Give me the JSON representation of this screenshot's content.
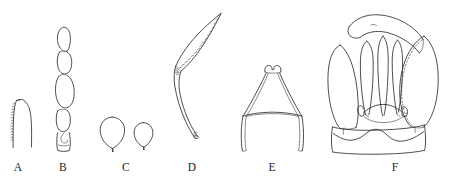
{
  "figure": {
    "type": "scientific-line-drawing-plate",
    "background_color": "#ffffff",
    "ink_color": "#2e2e30",
    "width": 456,
    "height": 181,
    "panel_count": 6,
    "label_row_y": 168
  },
  "panels": [
    {
      "id": "A",
      "label": "A",
      "label_x": 18,
      "label_y": 168,
      "subject": "serrated curved seta",
      "description": "slender curved spine with a row of fine teeth along the left margin"
    },
    {
      "id": "B",
      "label": "B",
      "label_x": 63,
      "label_y": 168,
      "subject": "segmented appendage",
      "description": "vertical chain of four to five elongate-oval articles, terminal article notched"
    },
    {
      "id": "C",
      "label": "C",
      "label_x": 126,
      "label_y": 168,
      "subject": "paired sensilla",
      "description": "two balloon- or teardrop-shaped bodies each tapering to a short basal stalk"
    },
    {
      "id": "D",
      "label": "D",
      "label_x": 192,
      "label_y": 168,
      "subject": "serrate falciform claw",
      "description": "long sickle-shaped claw bearing a dense comb of teeth along the inner edge, with a granulate basal articulation"
    },
    {
      "id": "E",
      "label": "E",
      "label_x": 272,
      "label_y": 168,
      "subject": "funnel-shaped sclerite",
      "description": "flask-like plate with a short bilobed neck, flaring sides and a broad concave base with downturned lateral arms"
    },
    {
      "id": "F",
      "label": "F",
      "label_x": 395,
      "label_y": 168,
      "subject": "genital capsule",
      "description": "broad capsule with paired lateral lobes, three median digitiform processes, a curved dorsal hook, an arched hook-tipped median bridge, and a wavy basal band; the right lobe is outlined in broken line"
    }
  ]
}
